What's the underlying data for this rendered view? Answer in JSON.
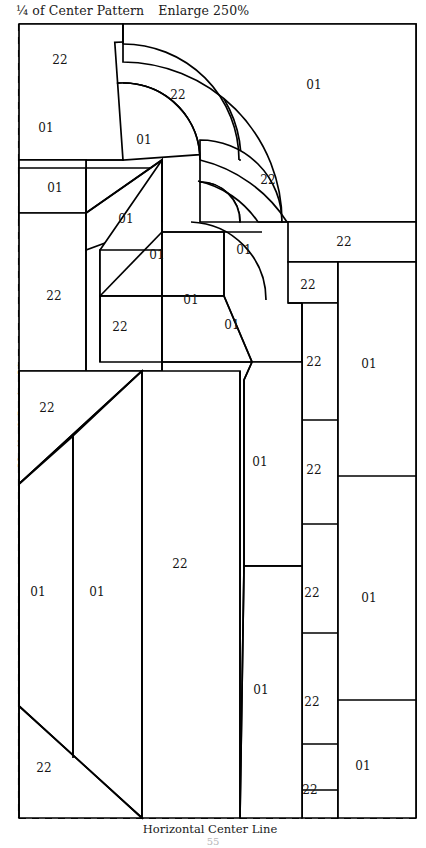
{
  "document": {
    "title_main": "¼ of Center Pattern",
    "title_note": "Enlarge 250%",
    "page_number": "55"
  },
  "axes": {
    "vertical_center_line": "Vertical Center Line",
    "horizontal_center_line": "Horizontal Center Line"
  },
  "colors": {
    "line": "#000000",
    "fill": "#ffffff",
    "dashed_guide": "#111111",
    "text": "#151515"
  },
  "frame": {
    "left": 19,
    "top": 24,
    "right": 416,
    "bottom": 818
  },
  "pattern": {
    "kind": "quilt-piecing-quarter-block",
    "fabric_codes": [
      "01",
      "22"
    ],
    "pieces": [
      {
        "id": "p01",
        "code": "22",
        "label_x": 60,
        "label_y": 60,
        "shape": "rect",
        "region": "top-left-upper"
      },
      {
        "id": "p02",
        "code": "01",
        "label_x": 46,
        "label_y": 128,
        "shape": "rect",
        "region": "left-upper-small"
      },
      {
        "id": "p03",
        "code": "01",
        "label_x": 55,
        "label_y": 188,
        "shape": "rect",
        "region": "left-second-small"
      },
      {
        "id": "p04",
        "code": "22",
        "label_x": 54,
        "label_y": 296,
        "shape": "rect",
        "region": "left-tall-block"
      },
      {
        "id": "p05",
        "code": "22",
        "label_x": 178,
        "label_y": 95,
        "shape": "arc-band",
        "region": "outer-arc-upper"
      },
      {
        "id": "p06",
        "code": "01",
        "label_x": 144,
        "label_y": 140,
        "shape": "arc-in",
        "region": "inner-of-outer-arc"
      },
      {
        "id": "p07",
        "code": "01",
        "label_x": 314,
        "label_y": 85,
        "shape": "rect",
        "region": "top-right-large"
      },
      {
        "id": "p08",
        "code": "22",
        "label_x": 268,
        "label_y": 180,
        "shape": "arc-band",
        "region": "second-arc-band"
      },
      {
        "id": "p09",
        "code": "01",
        "label_x": 126,
        "label_y": 219,
        "shape": "iso-top",
        "region": "step-top-face"
      },
      {
        "id": "p10",
        "code": "01",
        "label_x": 157,
        "label_y": 255,
        "shape": "iso-top",
        "region": "step-second-face"
      },
      {
        "id": "p11",
        "code": "01",
        "label_x": 191,
        "label_y": 300,
        "shape": "iso-top",
        "region": "step-third-face"
      },
      {
        "id": "p12",
        "code": "22",
        "label_x": 120,
        "label_y": 327,
        "shape": "rect",
        "region": "step-front-face"
      },
      {
        "id": "p13",
        "code": "01",
        "label_x": 232,
        "label_y": 325,
        "shape": "iso-side",
        "region": "step-right-face"
      },
      {
        "id": "p14",
        "code": "01",
        "label_x": 244,
        "label_y": 250,
        "shape": "arc-in",
        "region": "inner-arc-fill"
      },
      {
        "id": "p15",
        "code": "22",
        "label_x": 344,
        "label_y": 242,
        "shape": "rect",
        "region": "right-band-upper"
      },
      {
        "id": "p16",
        "code": "22",
        "label_x": 308,
        "label_y": 285,
        "shape": "rect",
        "region": "right-col-1"
      },
      {
        "id": "p17",
        "code": "22",
        "label_x": 314,
        "label_y": 362,
        "shape": "rect",
        "region": "right-col-2"
      },
      {
        "id": "p18",
        "code": "22",
        "label_x": 314,
        "label_y": 470,
        "shape": "rect",
        "region": "right-col-3"
      },
      {
        "id": "p19",
        "code": "22",
        "label_x": 312,
        "label_y": 593,
        "shape": "rect",
        "region": "right-col-4"
      },
      {
        "id": "p20",
        "code": "22",
        "label_x": 312,
        "label_y": 702,
        "shape": "rect",
        "region": "right-col-5"
      },
      {
        "id": "p21",
        "code": "22",
        "label_x": 310,
        "label_y": 790,
        "shape": "rect",
        "region": "right-col-6"
      },
      {
        "id": "p22",
        "code": "01",
        "label_x": 369,
        "label_y": 364,
        "shape": "rect",
        "region": "far-right-1"
      },
      {
        "id": "p23",
        "code": "01",
        "label_x": 369,
        "label_y": 598,
        "shape": "rect",
        "region": "far-right-2"
      },
      {
        "id": "p24",
        "code": "01",
        "label_x": 363,
        "label_y": 766,
        "shape": "rect",
        "region": "far-right-3"
      },
      {
        "id": "p25",
        "code": "01",
        "label_x": 260,
        "label_y": 462,
        "shape": "poly",
        "region": "center-right-upper"
      },
      {
        "id": "p26",
        "code": "01",
        "label_x": 261,
        "label_y": 690,
        "shape": "poly",
        "region": "center-right-lower"
      },
      {
        "id": "p27",
        "code": "22",
        "label_x": 47,
        "label_y": 408,
        "shape": "tri",
        "region": "left-upper-triangle"
      },
      {
        "id": "p28",
        "code": "01",
        "label_x": 38,
        "label_y": 592,
        "shape": "poly",
        "region": "big-strip-1"
      },
      {
        "id": "p29",
        "code": "01",
        "label_x": 97,
        "label_y": 592,
        "shape": "poly",
        "region": "big-strip-2"
      },
      {
        "id": "p30",
        "code": "22",
        "label_x": 180,
        "label_y": 564,
        "shape": "poly",
        "region": "big-strip-3"
      },
      {
        "id": "p31",
        "code": "22",
        "label_x": 44,
        "label_y": 768,
        "shape": "tri",
        "region": "left-lower-triangle"
      }
    ]
  }
}
